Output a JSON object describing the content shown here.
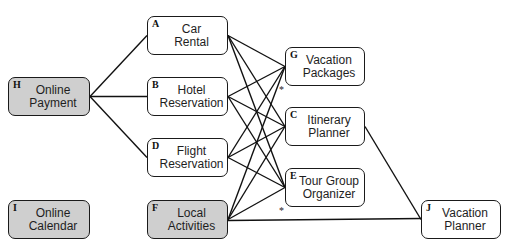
{
  "diagram": {
    "nodes": [
      {
        "id": "A",
        "line1": "Car",
        "line2": "Rental",
        "shaded": false,
        "x": 147,
        "y": 16,
        "w": 81,
        "h": 39
      },
      {
        "id": "B",
        "line1": "Hotel",
        "line2": "Reservation",
        "shaded": false,
        "x": 147,
        "y": 77,
        "w": 81,
        "h": 39
      },
      {
        "id": "D",
        "line1": "Flight",
        "line2": "Reservation",
        "shaded": false,
        "x": 147,
        "y": 138,
        "w": 81,
        "h": 39
      },
      {
        "id": "F",
        "line1": "Local",
        "line2": "Activities",
        "shaded": true,
        "x": 147,
        "y": 200,
        "w": 81,
        "h": 39
      },
      {
        "id": "H",
        "line1": "Online",
        "line2": "Payment",
        "shaded": true,
        "x": 8,
        "y": 77,
        "w": 82,
        "h": 39
      },
      {
        "id": "I",
        "line1": "Online",
        "line2": "Calendar",
        "shaded": true,
        "x": 8,
        "y": 200,
        "w": 82,
        "h": 39
      },
      {
        "id": "G",
        "line1": "Vacation",
        "line2": "Packages",
        "shaded": false,
        "x": 285,
        "y": 47,
        "w": 80,
        "h": 39
      },
      {
        "id": "C",
        "line1": "Itinerary",
        "line2": "Planner",
        "shaded": false,
        "x": 285,
        "y": 107,
        "w": 80,
        "h": 39
      },
      {
        "id": "E",
        "line1": "Tour Group",
        "line2": "Organizer",
        "shaded": false,
        "x": 285,
        "y": 168,
        "w": 80,
        "h": 39
      },
      {
        "id": "J",
        "line1": "Vacation",
        "line2": "Planner",
        "shaded": false,
        "x": 421,
        "y": 200,
        "w": 80,
        "h": 39
      }
    ],
    "edges": [
      [
        "H",
        "A"
      ],
      [
        "H",
        "B"
      ],
      [
        "H",
        "D"
      ],
      [
        "A",
        "G"
      ],
      [
        "A",
        "C"
      ],
      [
        "A",
        "E"
      ],
      [
        "B",
        "G"
      ],
      [
        "B",
        "C"
      ],
      [
        "B",
        "E"
      ],
      [
        "D",
        "G"
      ],
      [
        "D",
        "C"
      ],
      [
        "D",
        "E"
      ],
      [
        "F",
        "G"
      ],
      [
        "F",
        "C"
      ],
      [
        "F",
        "E"
      ],
      [
        "F",
        "J"
      ],
      [
        "C",
        "J"
      ]
    ],
    "annotations": [
      {
        "text": "*",
        "near": "G",
        "x": 280,
        "y": 85
      },
      {
        "text": "*",
        "near": "E",
        "x": 280,
        "y": 206
      }
    ],
    "colors": {
      "border": "#1a1a1a",
      "shaded_fill": "#cfcfcf",
      "plain_fill": "#ffffff",
      "edge": "#111111"
    }
  }
}
